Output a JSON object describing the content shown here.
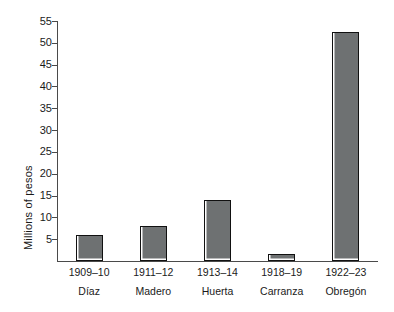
{
  "chart_data": {
    "type": "bar",
    "title": "",
    "xlabel": "",
    "ylabel": "Millions of pesos",
    "ylim": [
      0,
      55
    ],
    "yticks": [
      5,
      10,
      15,
      20,
      25,
      30,
      35,
      40,
      45,
      50,
      55
    ],
    "ytick_labels": [
      "5",
      "10",
      "15",
      "20",
      "25",
      "30",
      "35",
      "40",
      "45",
      "50",
      "55"
    ],
    "grid": false,
    "legend": "none",
    "categories": [
      "1909–10",
      "1911–12",
      "1913–14",
      "1918–19",
      "1922–23"
    ],
    "category_sublabels": [
      "Díaz",
      "Madero",
      "Huerta",
      "Carranza",
      "Obregón"
    ],
    "values": [
      6,
      8,
      14,
      1.5,
      52.5
    ],
    "bars": [
      {
        "years": "1909–10",
        "leader": "Díaz",
        "value": 6
      },
      {
        "years": "1911–12",
        "leader": "Madero",
        "value": 8
      },
      {
        "years": "1913–14",
        "leader": "Huerta",
        "value": 14
      },
      {
        "years": "1918–19",
        "leader": "Carranza",
        "value": 1.5
      },
      {
        "years": "1922–23",
        "leader": "Obregón",
        "value": 52.5
      }
    ],
    "colors": {
      "bar_fill": "#6e7172",
      "bar_outline": "#111111",
      "axis": "#4a4a4a",
      "text": "#1a1a1a",
      "background": "#ffffff"
    }
  }
}
